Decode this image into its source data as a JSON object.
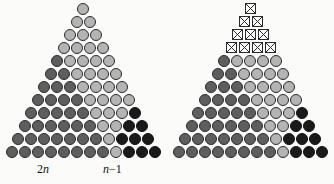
{
  "figure": {
    "rows": 12,
    "panels": [
      {
        "id": "left",
        "name": "left-triangle",
        "rows": [
          {
            "index": 1,
            "cells": [
              "light"
            ]
          },
          {
            "index": 2,
            "cells": [
              "light",
              "light"
            ]
          },
          {
            "index": 3,
            "cells": [
              "light",
              "light",
              "light"
            ]
          },
          {
            "index": 4,
            "cells": [
              "light",
              "light",
              "light",
              "light"
            ]
          },
          {
            "index": 5,
            "cells": [
              "mid",
              "light",
              "light",
              "light",
              "light"
            ]
          },
          {
            "index": 6,
            "cells": [
              "mid",
              "mid",
              "light",
              "light",
              "light",
              "light"
            ]
          },
          {
            "index": 7,
            "cells": [
              "mid",
              "mid",
              "mid",
              "light",
              "light",
              "light",
              "light"
            ]
          },
          {
            "index": 8,
            "cells": [
              "mid",
              "mid",
              "mid",
              "mid",
              "light",
              "light",
              "light",
              "light"
            ]
          },
          {
            "index": 9,
            "cells": [
              "mid",
              "mid",
              "mid",
              "mid",
              "mid",
              "light",
              "light",
              "light",
              "dark"
            ]
          },
          {
            "index": 10,
            "cells": [
              "mid",
              "mid",
              "mid",
              "mid",
              "mid",
              "mid",
              "light",
              "light",
              "dark",
              "dark"
            ]
          },
          {
            "index": 11,
            "cells": [
              "mid",
              "mid",
              "mid",
              "mid",
              "mid",
              "mid",
              "mid",
              "light",
              "dark",
              "dark",
              "dark"
            ]
          },
          {
            "index": 12,
            "cells": [
              "mid",
              "mid",
              "mid",
              "mid",
              "mid",
              "mid",
              "mid",
              "mid",
              "light",
              "dark",
              "dark",
              "dark"
            ]
          }
        ],
        "labels": {
          "left": {
            "base": "2",
            "variable": "n"
          },
          "right": {
            "variable": "n",
            "suffix": "−1"
          }
        }
      },
      {
        "id": "right",
        "name": "right-triangle",
        "rows": [
          {
            "index": 1,
            "cells": [
              "xbox"
            ]
          },
          {
            "index": 2,
            "cells": [
              "xbox",
              "xbox"
            ]
          },
          {
            "index": 3,
            "cells": [
              "xbox",
              "xbox",
              "xbox"
            ]
          },
          {
            "index": 4,
            "cells": [
              "xbox",
              "xbox",
              "xbox",
              "xbox"
            ]
          },
          {
            "index": 5,
            "cells": [
              "mid",
              "light",
              "light",
              "light",
              "light"
            ]
          },
          {
            "index": 6,
            "cells": [
              "mid",
              "mid",
              "light",
              "light",
              "light",
              "light"
            ]
          },
          {
            "index": 7,
            "cells": [
              "mid",
              "mid",
              "mid",
              "light",
              "light",
              "light",
              "light"
            ]
          },
          {
            "index": 8,
            "cells": [
              "mid",
              "mid",
              "mid",
              "mid",
              "light",
              "light",
              "light",
              "light"
            ]
          },
          {
            "index": 9,
            "cells": [
              "mid",
              "mid",
              "mid",
              "mid",
              "mid",
              "light",
              "light",
              "light",
              "dark"
            ]
          },
          {
            "index": 10,
            "cells": [
              "mid",
              "mid",
              "mid",
              "mid",
              "mid",
              "mid",
              "light",
              "light",
              "dark",
              "dark"
            ]
          },
          {
            "index": 11,
            "cells": [
              "mid",
              "mid",
              "mid",
              "mid",
              "mid",
              "mid",
              "mid",
              "light",
              "dark",
              "dark",
              "dark"
            ]
          },
          {
            "index": 12,
            "cells": [
              "mid",
              "mid",
              "mid",
              "mid",
              "mid",
              "mid",
              "mid",
              "mid",
              "light",
              "dark",
              "dark",
              "dark"
            ]
          }
        ],
        "labels": null
      }
    ],
    "colors": {
      "light_disc": "#b4b4b4",
      "mid_disc": "#5e5e5e",
      "dark_disc": "#1a1a1a",
      "disc_outline": "#2b2b2b",
      "xbox_fill": "#ffffff",
      "xbox_stroke": "#2a2a2a",
      "background": "#fbfbfa",
      "label_color": "#111111"
    },
    "geometry": {
      "cell_pitch": 13,
      "disc_diameter": 12,
      "row_pitch": 13,
      "top_offset": 3,
      "panel_width": 167
    }
  }
}
